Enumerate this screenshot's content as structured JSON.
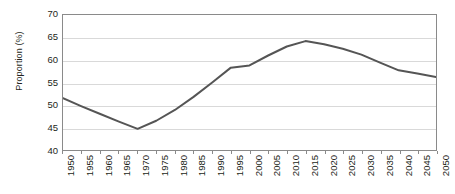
{
  "chart_data": {
    "type": "line",
    "title": "",
    "xlabel": "",
    "ylabel": "Proportion (%)",
    "ylim": [
      40,
      70
    ],
    "y_ticks": [
      40,
      45,
      50,
      55,
      60,
      65,
      70
    ],
    "xlim": [
      1950,
      2050
    ],
    "grid": true,
    "legend": "none",
    "line_color": "#555555",
    "axis_color": "#8a8a8a",
    "gridline_color": "#d9d9d9",
    "categories": [
      "1950",
      "1955",
      "1960",
      "1965",
      "1970",
      "1975",
      "1980",
      "1985",
      "1990",
      "1995",
      "2000",
      "2005",
      "2010",
      "2015",
      "2020",
      "2025",
      "2030",
      "2035",
      "2040",
      "2045",
      "2050"
    ],
    "x": [
      1950,
      1955,
      1960,
      1965,
      1970,
      1975,
      1980,
      1985,
      1990,
      1995,
      2000,
      2005,
      2010,
      2015,
      2020,
      2025,
      2030,
      2035,
      2040,
      2045,
      2050
    ],
    "values": [
      51.5,
      49.7,
      48.0,
      46.3,
      44.7,
      46.5,
      48.9,
      51.8,
      55.0,
      58.3,
      58.8,
      61.0,
      63.0,
      64.2,
      63.5,
      62.5,
      61.2,
      59.4,
      57.7,
      57.0,
      56.2
    ],
    "series": [
      {
        "name": "Proportion",
        "values": [
          51.5,
          49.7,
          48.0,
          46.3,
          44.7,
          46.5,
          48.9,
          51.8,
          55.0,
          58.3,
          58.8,
          61.0,
          63.0,
          64.2,
          63.5,
          62.5,
          61.2,
          59.4,
          57.7,
          57.0,
          56.2
        ]
      }
    ]
  }
}
